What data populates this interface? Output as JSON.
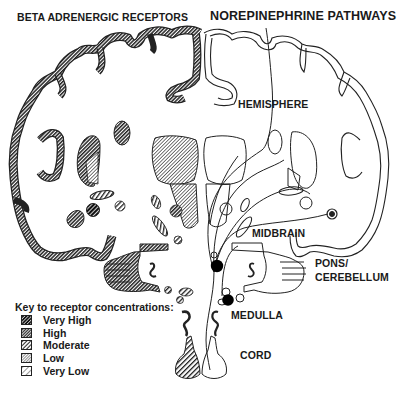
{
  "titles": {
    "left": "BETA ADRENERGIC RECEPTORS",
    "right": "NOREPINEPHRINE PATHWAYS"
  },
  "regions": {
    "hemisphere": "HEMISPHERE",
    "midbrain": "MIDBRAIN",
    "pons_line1": "PONS/",
    "pons_line2": "CEREBELLUM",
    "medulla": "MEDULLA",
    "cord": "CORD"
  },
  "legend": {
    "title": "Key to receptor concentrations:",
    "items": [
      {
        "label": "Very High",
        "pattern": "very-high"
      },
      {
        "label": "High",
        "pattern": "high"
      },
      {
        "label": "Moderate",
        "pattern": "moderate"
      },
      {
        "label": "Low",
        "pattern": "low"
      },
      {
        "label": "Very Low",
        "pattern": "very-low"
      }
    ]
  },
  "colors": {
    "ink": "#1a1a1a",
    "background": "#ffffff",
    "nucleus_fill": "#000000"
  }
}
